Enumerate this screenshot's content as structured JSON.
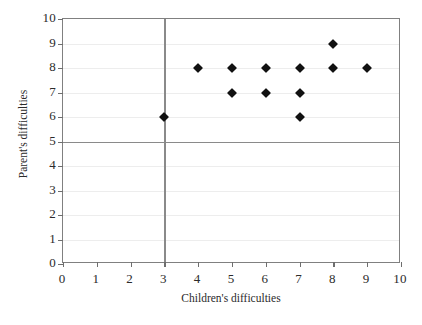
{
  "chart_data": {
    "type": "scatter",
    "title": "",
    "xlabel": "Children's difficulties",
    "ylabel": "Parent's difficulties",
    "xlim": [
      0,
      10
    ],
    "ylim": [
      0,
      10
    ],
    "xticks": [
      0,
      1,
      2,
      3,
      4,
      5,
      6,
      7,
      8,
      9,
      10
    ],
    "yticks": [
      0,
      1,
      2,
      3,
      4,
      5,
      6,
      7,
      8,
      9,
      10
    ],
    "grid": true,
    "legend": null,
    "marker": "diamond",
    "marker_color": "#111111",
    "points": [
      {
        "x": 3,
        "y": 6
      },
      {
        "x": 4,
        "y": 8
      },
      {
        "x": 5,
        "y": 8
      },
      {
        "x": 5,
        "y": 7
      },
      {
        "x": 6,
        "y": 8
      },
      {
        "x": 6,
        "y": 7
      },
      {
        "x": 7,
        "y": 8
      },
      {
        "x": 7,
        "y": 7
      },
      {
        "x": 7,
        "y": 6
      },
      {
        "x": 8,
        "y": 9
      },
      {
        "x": 8,
        "y": 8
      },
      {
        "x": 9,
        "y": 8
      }
    ],
    "reference_lines": [
      {
        "orientation": "horizontal",
        "value": 5,
        "color": "#8a8a8a"
      },
      {
        "orientation": "vertical",
        "value": 3,
        "color": "#8a8a8a"
      }
    ],
    "colors": {
      "plot_border": "#808080",
      "gridline": "#ededed",
      "reference_line": "#8a8a8a",
      "text": "#2b2b2b",
      "background": "#ffffff"
    }
  }
}
